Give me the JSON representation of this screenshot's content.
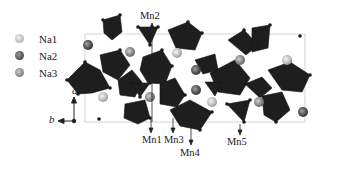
{
  "figure": {
    "type": "crystal-structure",
    "legend": [
      {
        "label": "Na1",
        "color": "#bdbdbd"
      },
      {
        "label": "Na2",
        "color": "#555555"
      },
      {
        "label": "Na3",
        "color": "#8c8c8c"
      }
    ],
    "axes": {
      "vertical": "a",
      "horizontal": "b"
    },
    "labels": {
      "top": [
        "Mn2"
      ],
      "bottom": [
        "Mn1",
        "Mn3",
        "Mn4",
        "Mn5"
      ]
    },
    "colors": {
      "polyhedra": "#1e1e1e",
      "cell_outline": "#c8c8c8",
      "text": "#222222"
    }
  }
}
